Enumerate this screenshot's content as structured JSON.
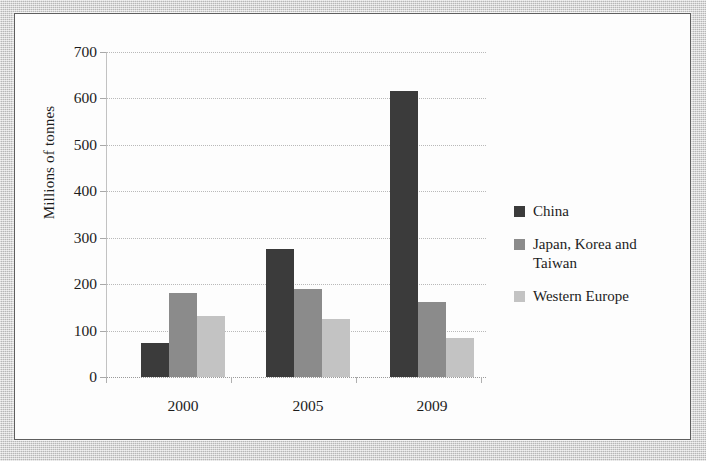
{
  "figure": {
    "y_axis_title": "Millions of tonnes"
  },
  "chart_data": {
    "type": "bar",
    "title": "",
    "xlabel": "",
    "ylabel": "Millions of tonnes",
    "ylim": [
      0,
      700
    ],
    "yticks": [
      0,
      100,
      200,
      300,
      400,
      500,
      600,
      700
    ],
    "ytick_labels": [
      "0",
      "100",
      "200",
      "300",
      "400",
      "500",
      "600",
      "700"
    ],
    "grid": true,
    "legend_position": "right",
    "categories": [
      "2000",
      "2005",
      "2009"
    ],
    "series": [
      {
        "name": "China",
        "color": "#3b3b3b",
        "values": [
          74,
          275,
          617
        ]
      },
      {
        "name": "Japan, Korea and Taiwan",
        "color": "#8b8b8b",
        "values": [
          182,
          190,
          162
        ]
      },
      {
        "name": "Western Europe",
        "color": "#c3c3c3",
        "values": [
          131,
          124,
          83
        ]
      }
    ]
  }
}
